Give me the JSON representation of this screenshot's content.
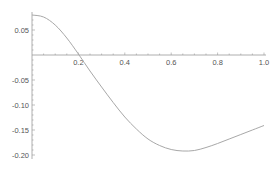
{
  "chart_data": {
    "type": "line",
    "title": "",
    "xlabel": "",
    "ylabel": "",
    "xlim": [
      0,
      1.0
    ],
    "ylim": [
      -0.2,
      0.08
    ],
    "grid": false,
    "legend": null,
    "x_ticks": [
      "0.2",
      "0.4",
      "0.6",
      "0.8",
      "1.0"
    ],
    "y_ticks": [
      "0.05",
      "-0.05",
      "-0.10",
      "-0.15",
      "-0.20"
    ],
    "series": [
      {
        "name": "f(x)",
        "color": "#a8a8a8",
        "x": [
          0.0,
          0.05,
          0.1,
          0.15,
          0.2,
          0.25,
          0.3,
          0.35,
          0.4,
          0.45,
          0.5,
          0.55,
          0.6,
          0.65,
          0.7,
          0.75,
          0.8,
          0.85,
          0.9,
          0.95,
          1.0
        ],
        "y": [
          0.08,
          0.076,
          0.06,
          0.034,
          0.002,
          -0.032,
          -0.064,
          -0.095,
          -0.124,
          -0.148,
          -0.168,
          -0.181,
          -0.189,
          -0.192,
          -0.191,
          -0.185,
          -0.177,
          -0.168,
          -0.159,
          -0.15,
          -0.141
        ]
      }
    ]
  },
  "colors": {
    "axis": "#999999",
    "curve": "#a8a8a8",
    "text": "#555555"
  }
}
